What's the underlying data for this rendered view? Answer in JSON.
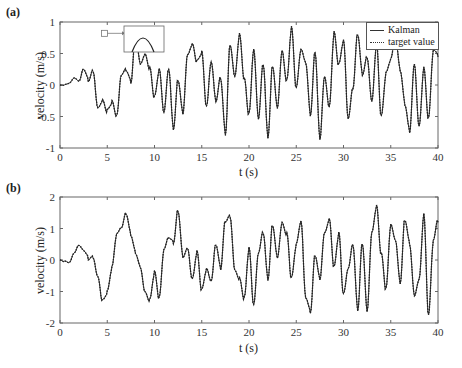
{
  "chart_data": [
    {
      "type": "line",
      "panel_label": "(a)",
      "title": "",
      "xlabel": "t (s)",
      "ylabel": "velocity (m/s)",
      "xlim": [
        0,
        40
      ],
      "ylim": [
        -1,
        1
      ],
      "xticks": [
        0,
        5,
        10,
        15,
        20,
        25,
        30,
        35,
        40
      ],
      "yticks": [
        -1,
        -0.5,
        0,
        0.5,
        1
      ],
      "ytick_labels": [
        "-1",
        "-0.5",
        "0",
        "0.5",
        "1"
      ],
      "grid": false,
      "legend_position": "upper right",
      "legend": [
        "Kalman",
        "target value"
      ],
      "inset": {
        "description": "zoomed view of peak near t≈4.7 s",
        "marker_x": 4.7,
        "marker_y": 0.82
      },
      "x_step": 0.5,
      "series": [
        {
          "name": "Kalman",
          "style": "solid",
          "values": [
            0,
            0,
            0.02,
            0.1,
            0.05,
            0.25,
            0.1,
            0.28,
            -0.3,
            -0.2,
            -0.4,
            -0.3,
            -0.55,
            0.1,
            0.2,
            0.05,
            0.82,
            0.4,
            0.55,
            0.3,
            -0.2,
            0.2,
            -0.5,
            0.2,
            -0.72,
            0.1,
            -0.4,
            0.55,
            0.7,
            0.4,
            0.5,
            -0.4,
            0.3,
            -0.3,
            0.1,
            -0.75,
            0.7,
            0.2,
            0.85,
            0.1,
            -0.5,
            0.5,
            -0.6,
            0.3,
            -0.82,
            0.35,
            -0.3,
            0.6,
            0.1,
            0.9,
            -0.1,
            0.5,
            0.3,
            -0.5,
            0.55,
            -0.8,
            0.2,
            -0.3,
            0.85,
            0.3,
            0.65,
            -0.6,
            -0.1,
            0.8,
            0.2,
            0.5,
            -0.2,
            0.7,
            -0.5,
            0.15,
            0.35,
            0.7,
            0.2,
            -0.3,
            -0.7,
            0.4,
            -0.6,
            0.3,
            -0.55,
            0.5,
            0.45
          ]
        },
        {
          "name": "target value",
          "style": "dotted",
          "values": [
            0,
            0,
            0.02,
            0.1,
            0.05,
            0.25,
            0.1,
            0.28,
            -0.3,
            -0.2,
            -0.4,
            -0.3,
            -0.55,
            0.1,
            0.2,
            0.05,
            0.82,
            0.4,
            0.55,
            0.3,
            -0.2,
            0.2,
            -0.5,
            0.2,
            -0.72,
            0.1,
            -0.4,
            0.55,
            0.7,
            0.4,
            0.5,
            -0.4,
            0.3,
            -0.3,
            0.1,
            -0.75,
            0.7,
            0.2,
            0.85,
            0.1,
            -0.5,
            0.5,
            -0.6,
            0.3,
            -0.82,
            0.35,
            -0.3,
            0.6,
            0.1,
            0.9,
            -0.1,
            0.5,
            0.3,
            -0.5,
            0.55,
            -0.8,
            0.2,
            -0.3,
            0.85,
            0.3,
            0.65,
            -0.6,
            -0.1,
            0.8,
            0.2,
            0.5,
            -0.2,
            0.7,
            -0.5,
            0.15,
            0.35,
            0.7,
            0.2,
            -0.3,
            -0.7,
            0.4,
            -0.6,
            0.3,
            -0.55,
            0.5,
            0.45
          ]
        }
      ]
    },
    {
      "type": "line",
      "panel_label": "(b)",
      "title": "",
      "xlabel": "t (s)",
      "ylabel": "velocity (m/s)",
      "xlim": [
        0,
        40
      ],
      "ylim": [
        -2,
        2
      ],
      "xticks": [
        0,
        5,
        10,
        15,
        20,
        25,
        30,
        35,
        40
      ],
      "yticks": [
        -2,
        -1,
        0,
        1,
        2
      ],
      "ytick_labels": [
        "-2",
        "-1",
        "0",
        "1",
        "2"
      ],
      "grid": false,
      "x_step": 0.5,
      "series": [
        {
          "name": "Kalman",
          "style": "solid",
          "values": [
            0,
            -0.05,
            -0.1,
            0.2,
            0.45,
            0.3,
            0.1,
            0.2,
            -0.4,
            -1.2,
            -1.0,
            -0.3,
            0.7,
            0.9,
            1.4,
            0.8,
            0.3,
            -0.1,
            -0.9,
            -1.2,
            -0.4,
            -1.3,
            0.2,
            0.6,
            0.5,
            1.6,
            0.2,
            0.5,
            -0.5,
            0.3,
            -1.0,
            -0.4,
            -0.8,
            0.4,
            -0.3,
            1.3,
            1.5,
            -0.2,
            -0.5,
            -1.2,
            0.3,
            -1.55,
            0.1,
            0.8,
            -0.6,
            1.2,
            0.2,
            1.3,
            0.9,
            -0.6,
            0.4,
            1.1,
            -1.3,
            -1.7,
            0.2,
            -0.5,
            1.0,
            1.4,
            -0.2,
            0.8,
            -1.2,
            -0.4,
            0.4,
            -1.6,
            0.6,
            -1.5,
            1.0,
            1.8,
            0.2,
            -1.0,
            1.0,
            0.5,
            -0.8,
            1.3,
            0.6,
            -1.0,
            -0.5,
            1.5,
            -1.8,
            0.5,
            1.2
          ]
        },
        {
          "name": "target value",
          "style": "dotted",
          "values": [
            0,
            -0.05,
            -0.1,
            0.2,
            0.45,
            0.3,
            0.1,
            0.2,
            -0.4,
            -1.2,
            -1.0,
            -0.3,
            0.7,
            0.9,
            1.4,
            0.8,
            0.3,
            -0.1,
            -0.9,
            -1.2,
            -0.4,
            -1.3,
            0.2,
            0.6,
            0.5,
            1.6,
            0.2,
            0.5,
            -0.5,
            0.3,
            -1.0,
            -0.4,
            -0.8,
            0.4,
            -0.3,
            1.3,
            1.5,
            -0.2,
            -0.5,
            -1.2,
            0.3,
            -1.55,
            0.1,
            0.8,
            -0.6,
            1.2,
            0.2,
            1.3,
            0.9,
            -0.6,
            0.4,
            1.1,
            -1.3,
            -1.7,
            0.2,
            -0.5,
            1.0,
            1.4,
            -0.2,
            0.8,
            -1.2,
            -0.4,
            0.4,
            -1.6,
            0.6,
            -1.5,
            1.0,
            1.8,
            0.2,
            -1.0,
            1.0,
            0.5,
            -0.8,
            1.3,
            0.6,
            -1.0,
            -0.5,
            1.5,
            -1.8,
            0.5,
            1.2
          ]
        }
      ]
    }
  ]
}
